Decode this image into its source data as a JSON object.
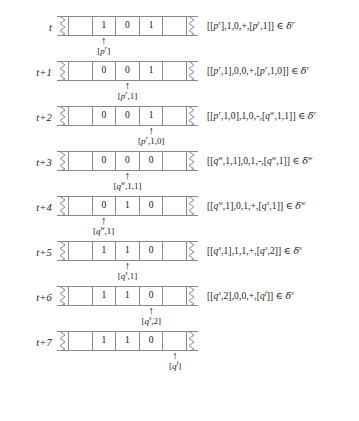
{
  "figure": {
    "tape_cell_count": 5,
    "colors": {
      "tape_border": "#8a8a8a",
      "text": "#1a1a1a",
      "background": "#ffffff"
    },
    "rows": [
      {
        "time_label": "t",
        "cells": [
          "",
          "1",
          "0",
          "1",
          ""
        ],
        "head_index": 1,
        "head_state": "[pʳ]",
        "head_state_base": "[p",
        "head_state_sup": "r",
        "head_state_tail": "]",
        "formula": {
          "source_state": "[pʳ]",
          "read": "1",
          "write": "0",
          "move": "+",
          "target_state": "[pʳ,1]",
          "delta": "δʳ",
          "text": "[[pʳ],1,0,+,[pʳ,1]] ∈ δʳ"
        }
      },
      {
        "time_label": "t+1",
        "cells": [
          "",
          "0",
          "0",
          "1",
          ""
        ],
        "head_index": 2,
        "head_state": "[pʳ,1]",
        "formula": {
          "source_state": "[pʳ,1]",
          "read": "0",
          "write": "0",
          "move": "+",
          "target_state": "[pʳ,1,0]",
          "delta": "δʳ",
          "text": "[[pʳ,1],0,0,+,[pʳ,1,0]] ∈ δʳ"
        }
      },
      {
        "time_label": "t+2",
        "cells": [
          "",
          "0",
          "0",
          "1",
          ""
        ],
        "head_index": 3,
        "head_state": "[pʳ,1,0]",
        "formula": {
          "source_state": "[pʳ,1,0]",
          "read": "1",
          "write": "0",
          "move": "-",
          "target_state": "[qʷ,1,1]",
          "delta": "δʳ",
          "text": "[[pʳ,1,0],1,0,-,[qʷ,1,1]] ∈ δʳ"
        }
      },
      {
        "time_label": "t+3",
        "cells": [
          "",
          "0",
          "0",
          "0",
          ""
        ],
        "head_index": 2,
        "head_state": "[qʷ,1,1]",
        "formula": {
          "source_state": "[qʷ,1,1]",
          "read": "0",
          "write": "1",
          "move": "-",
          "target_state": "[qʷ,1]",
          "delta": "δʷ",
          "text": "[[qʷ,1,1],0,1,-,[qʷ,1]] ∈ δʷ"
        }
      },
      {
        "time_label": "t+4",
        "cells": [
          "",
          "0",
          "1",
          "0",
          ""
        ],
        "head_index": 1,
        "head_state": "[qʷ,1]",
        "formula": {
          "source_state": "[qʷ,1]",
          "read": "0",
          "write": "1",
          "move": "+",
          "target_state": "[qˢ,1]",
          "delta": "δʷ",
          "text": "[[qʷ,1],0,1,+,[qˢ,1]] ∈ δʷ"
        }
      },
      {
        "time_label": "t+5",
        "cells": [
          "",
          "1",
          "1",
          "0",
          ""
        ],
        "head_index": 2,
        "head_state": "[qˢ,1]",
        "formula": {
          "source_state": "[qˢ,1]",
          "read": "1",
          "write": "1",
          "move": "+",
          "target_state": "[qˢ,2]",
          "delta": "δˢ",
          "text": "[[qˢ,1],1,1,+,[qˢ,2]] ∈ δˢ"
        }
      },
      {
        "time_label": "t+6",
        "cells": [
          "",
          "1",
          "1",
          "0",
          ""
        ],
        "head_index": 3,
        "head_state": "[qˢ,2]",
        "formula": {
          "source_state": "[qˢ,2]",
          "read": "0",
          "write": "0",
          "move": "+",
          "target_state": "[qᶠ]",
          "delta": "δˢ",
          "text": "[[qˢ,2],0,0,+,[qᶠ]] ∈ δˢ"
        }
      },
      {
        "time_label": "t+7",
        "cells": [
          "",
          "1",
          "1",
          "0",
          ""
        ],
        "head_index": 4,
        "head_state": "[qᶠ]",
        "formula": null
      }
    ]
  }
}
